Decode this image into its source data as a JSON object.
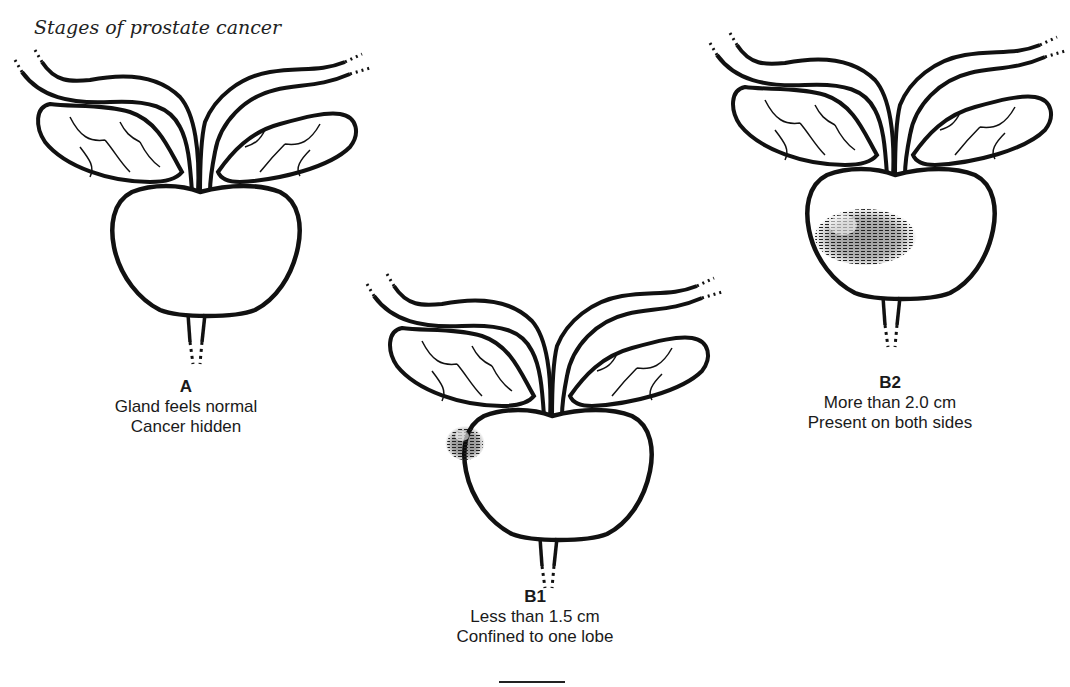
{
  "title": "Stages of prostate cancer",
  "figures": [
    {
      "id": "A",
      "stage": "A",
      "lines": [
        "Gland feels normal",
        "Cancer hidden"
      ],
      "tumor": "none"
    },
    {
      "id": "B1",
      "stage": "B1",
      "lines": [
        "Less than 1.5 cm",
        "Confined to one lobe"
      ],
      "tumor": "small spot on left lobe"
    },
    {
      "id": "B2",
      "stage": "B2",
      "lines": [
        "More than 2.0 cm",
        "Present on both sides"
      ],
      "tumor": "large area spanning both sides"
    }
  ],
  "colors": {
    "ink": "#111111",
    "background": "#ffffff"
  }
}
